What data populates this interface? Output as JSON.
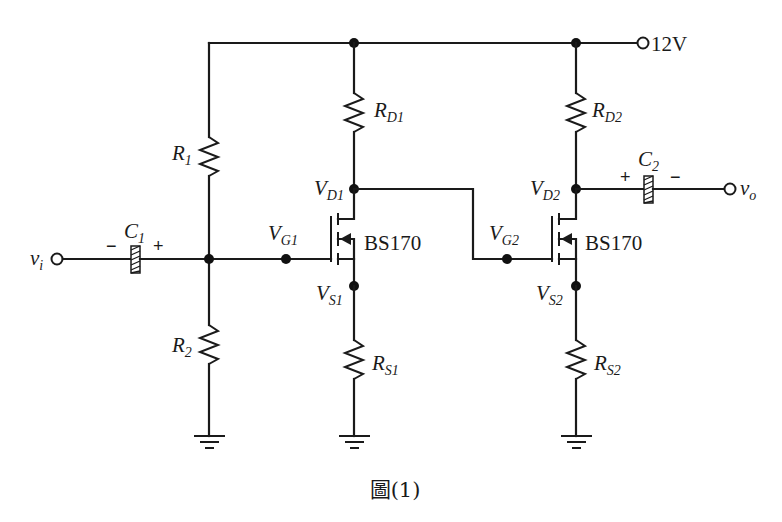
{
  "figure": {
    "caption": "圖(1)",
    "supply_label": "12V",
    "input_label": "v",
    "input_sub": "i",
    "output_label": "v",
    "output_sub": "o"
  },
  "components": {
    "R1": {
      "main": "R",
      "sub": "1"
    },
    "R2": {
      "main": "R",
      "sub": "2"
    },
    "RD1": {
      "main": "R",
      "sub": "D1"
    },
    "RD2": {
      "main": "R",
      "sub": "D2"
    },
    "RS1": {
      "main": "R",
      "sub": "S1"
    },
    "RS2": {
      "main": "R",
      "sub": "S2"
    },
    "C1": {
      "main": "C",
      "sub": "1",
      "left_sign": "−",
      "right_sign": "+"
    },
    "C2": {
      "main": "C",
      "sub": "2",
      "left_sign": "+",
      "right_sign": "−"
    },
    "M1": {
      "part": "BS170"
    },
    "M2": {
      "part": "BS170"
    }
  },
  "nodes": {
    "VD1": {
      "main": "V",
      "sub": "D1"
    },
    "VG1": {
      "main": "V",
      "sub": "G1"
    },
    "VS1": {
      "main": "V",
      "sub": "S1"
    },
    "VD2": {
      "main": "V",
      "sub": "D2"
    },
    "VG2": {
      "main": "V",
      "sub": "G2"
    },
    "VS2": {
      "main": "V",
      "sub": "S2"
    }
  },
  "colors": {
    "ink": "#1a1a1a",
    "background": "#ffffff"
  }
}
